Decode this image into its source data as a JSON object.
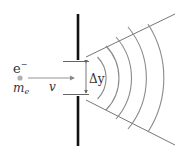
{
  "diagram": {
    "labels": {
      "particle": "e",
      "charge": "−",
      "mass_m": "m",
      "mass_sub": "e",
      "velocity": "v",
      "slit_width": "Δy"
    },
    "colors": {
      "wall": "#111111",
      "lines": "#777777",
      "arcs": "#8a8a8a",
      "dot": "#aaaaaa",
      "text": "#333333"
    }
  }
}
